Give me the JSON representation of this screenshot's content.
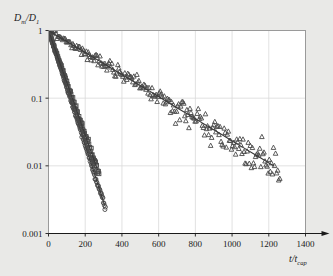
{
  "figure": {
    "background_color": "#e9e9e7",
    "plot_background_color": "#ffffff",
    "frame_color": "#9a9a9a",
    "grid_color": "#d9d9d9",
    "marker_color": "#4a4a4a",
    "line_color": "#3a3a3a"
  },
  "axes": {
    "y_label_main": "D",
    "y_label_sub1": "m",
    "y_label_slash": "/",
    "y_label_main2": "D",
    "y_label_sub2": "1",
    "x_label_main": "t",
    "x_label_slash": "/",
    "x_label_main2": "t",
    "x_label_sub": "cap",
    "y_scale": "log",
    "x_scale": "linear",
    "x_ticks": [
      0,
      200,
      400,
      600,
      800,
      1000,
      1200,
      1400
    ],
    "x_tick_labels": [
      "0",
      "200",
      "400",
      "600",
      "800",
      "1000",
      "1200",
      "1400"
    ],
    "y_ticks": [
      1,
      0.1,
      0.01,
      0.001
    ],
    "y_tick_labels": [
      "1",
      "0.1",
      "0.01",
      "0.001"
    ],
    "xlim": [
      0,
      1400
    ],
    "ylim": [
      0.001,
      1
    ],
    "x_axis_arrow": true,
    "grid": "both"
  },
  "chart_data": {
    "type": "scatter",
    "title": "",
    "xlabel": "t/t_cap",
    "ylabel": "D_m/D_1",
    "xlim": [
      0,
      1400
    ],
    "ylim": [
      0.001,
      1
    ],
    "yscale": "log",
    "grid": true,
    "legend": "none",
    "series": [
      {
        "name": "circles",
        "marker": "circle",
        "decay_rate": 0.0195,
        "t_start": 0,
        "t_end": 310,
        "n_points": 120,
        "noise": 0.05,
        "fit_line": true,
        "x": [
          0,
          3,
          6,
          9,
          12,
          15,
          18,
          21,
          24,
          27,
          30,
          34,
          38,
          42,
          46,
          50,
          55,
          60,
          66,
          72,
          79,
          86,
          94,
          102,
          111,
          120,
          130,
          141,
          153,
          166,
          180,
          195,
          211,
          228,
          246,
          265,
          285,
          305
        ],
        "y": [
          1.0,
          0.944,
          0.891,
          0.841,
          0.794,
          0.75,
          0.708,
          0.668,
          0.63,
          0.595,
          0.562,
          0.52,
          0.482,
          0.446,
          0.413,
          0.382,
          0.348,
          0.316,
          0.281,
          0.25,
          0.217,
          0.188,
          0.161,
          0.137,
          0.115,
          0.0966,
          0.0797,
          0.0644,
          0.051,
          0.0395,
          0.0301,
          0.0224,
          0.0164,
          0.0118,
          0.00832,
          0.00575,
          0.0039,
          0.00265
        ]
      },
      {
        "name": "squares",
        "marker": "square",
        "decay_rate": 0.0178,
        "t_start": 0,
        "t_end": 275,
        "n_points": 110,
        "noise": 0.09,
        "fit_line": true,
        "x": [
          0,
          5,
          10,
          16,
          22,
          29,
          36,
          44,
          52,
          61,
          70,
          80,
          90,
          101,
          112,
          124,
          136,
          149,
          162,
          176,
          190,
          205,
          220,
          236,
          252,
          268
        ],
        "y": [
          1.0,
          0.915,
          0.838,
          0.751,
          0.673,
          0.596,
          0.528,
          0.457,
          0.396,
          0.337,
          0.287,
          0.241,
          0.202,
          0.167,
          0.138,
          0.112,
          0.0903,
          0.0715,
          0.0566,
          0.044,
          0.0342,
          0.0261,
          0.0199,
          0.0151,
          0.0114,
          0.00855
        ]
      },
      {
        "name": "triangles",
        "marker": "triangle",
        "decay_rate": 0.00375,
        "t_start": 0,
        "t_end": 1260,
        "n_points": 230,
        "noise": 0.28,
        "fit_line": true,
        "x": [
          0,
          20,
          45,
          70,
          100,
          130,
          165,
          200,
          240,
          280,
          325,
          370,
          420,
          470,
          520,
          575,
          630,
          690,
          750,
          810,
          870,
          930,
          990,
          1050,
          1110,
          1170,
          1230
        ],
        "y": [
          1.0,
          0.928,
          0.845,
          0.769,
          0.687,
          0.613,
          0.538,
          0.472,
          0.407,
          0.351,
          0.296,
          0.25,
          0.207,
          0.172,
          0.142,
          0.116,
          0.0938,
          0.0749,
          0.0598,
          0.0478,
          0.0381,
          0.0305,
          0.0243,
          0.0194,
          0.0155,
          0.0124,
          0.00987
        ]
      }
    ]
  }
}
